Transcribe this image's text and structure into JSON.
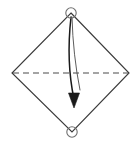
{
  "figure": {
    "type": "diagram",
    "background_color": "#ffffff",
    "stroke_color": "#3a3a3a",
    "dash_color": "#4a4a4a",
    "arrow_color": "#1a1a1a",
    "marker_color": "#6e6e6e",
    "canvas": {
      "width": 138,
      "height": 145
    },
    "shape": {
      "name": "diamond",
      "description": "square rotated 45 degrees",
      "vertices": {
        "top": {
          "x": 71,
          "y": 13
        },
        "right": {
          "x": 129,
          "y": 73
        },
        "bottom": {
          "x": 72,
          "y": 132
        },
        "left": {
          "x": 12,
          "y": 73
        }
      }
    },
    "fold_line": {
      "name": "horizontal-dashed-fold-line",
      "from": {
        "x": 13,
        "y": 73
      },
      "to": {
        "x": 128,
        "y": 73
      },
      "style": "dashed",
      "dash_pattern": "6 4"
    },
    "markers": [
      {
        "name": "top-vertex-circle",
        "cx": 71,
        "cy": 13,
        "r": 5.2
      },
      {
        "name": "bottom-vertex-circle",
        "cx": 72,
        "cy": 132,
        "r": 5.2
      }
    ],
    "fold_arrow": {
      "name": "fold-arrow",
      "direction": "downward",
      "start": {
        "x": 71,
        "y": 17
      },
      "tip": {
        "x": 74,
        "y": 108
      },
      "curve_control": {
        "x": 66,
        "y": 62
      }
    },
    "guide_curve": {
      "name": "fold-guide-curve",
      "start": {
        "x": 72,
        "y": 17
      },
      "end": {
        "x": 80,
        "y": 90
      },
      "curve_control": {
        "x": 73,
        "y": 55
      }
    }
  }
}
